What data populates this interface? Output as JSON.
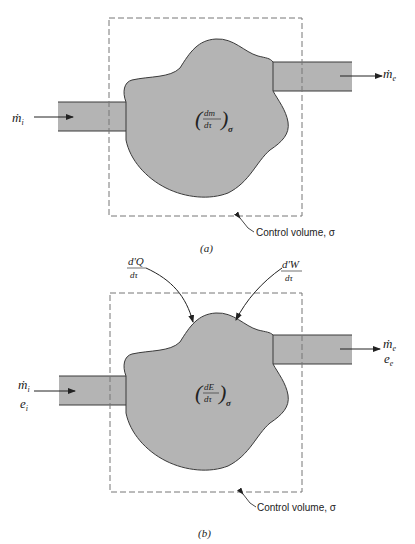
{
  "figure_a": {
    "caption": "(a)",
    "inlet_label": "ṁ",
    "inlet_sub": "i",
    "outlet_label": "ṁ",
    "outlet_sub": "e",
    "center_num": "dm",
    "center_den": "dτ",
    "center_sub": "σ",
    "cv_label": "Control volume, σ"
  },
  "figure_b": {
    "caption": "(b)",
    "inlet_label": "ṁ",
    "inlet_sub": "i",
    "inlet_energy": "e",
    "inlet_energy_sub": "i",
    "outlet_label": "ṁ",
    "outlet_sub": "e",
    "outlet_energy": "e",
    "outlet_energy_sub": "e",
    "center_num": "dE",
    "center_den": "dτ",
    "center_sub": "σ",
    "heat_num": "d'Q",
    "heat_den": "dτ",
    "work_num": "d'W",
    "work_den": "dτ",
    "cv_label": "Control volume, σ"
  },
  "colors": {
    "fluid_fill": "#b4b4b4",
    "outline": "#3a3a3a",
    "cv_dash": "#777777"
  }
}
